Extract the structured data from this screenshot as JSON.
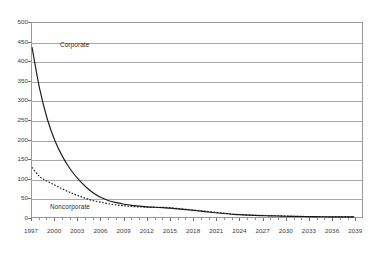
{
  "chart_data": {
    "type": "line",
    "title": "",
    "subtitle": "",
    "xlabel": "",
    "ylabel": "",
    "grid": true,
    "legend_position": "inline-annotation",
    "xlim": [
      1997,
      2040
    ],
    "ylim": [
      0,
      500
    ],
    "y_ticks": [
      0,
      50,
      100,
      150,
      200,
      250,
      300,
      350,
      400,
      450,
      500
    ],
    "x_ticks": [
      1997,
      2000,
      2003,
      2006,
      2009,
      2012,
      2015,
      2018,
      2021,
      2024,
      2027,
      2030,
      2033,
      2036,
      2039
    ],
    "x": [
      1997,
      1998,
      1999,
      2000,
      2001,
      2002,
      2003,
      2004,
      2005,
      2006,
      2007,
      2008,
      2009,
      2010,
      2011,
      2012,
      2013,
      2014,
      2015,
      2016,
      2017,
      2018,
      2019,
      2020,
      2021,
      2022,
      2023,
      2024,
      2025,
      2026,
      2027,
      2028,
      2029,
      2030,
      2031,
      2032,
      2033,
      2034,
      2035,
      2036,
      2037,
      2038,
      2039
    ],
    "series": [
      {
        "name": "Corporate",
        "style": "solid",
        "color": "#1a1a1a",
        "values": [
          438,
          330,
          252,
          196,
          155,
          123,
          98,
          78,
          62,
          50,
          42,
          37,
          33,
          30,
          28,
          26,
          25,
          24,
          23,
          21,
          19,
          17,
          15,
          13,
          11,
          9,
          7,
          6,
          5,
          4,
          3.5,
          3,
          2.5,
          2,
          1.6,
          1.3,
          1,
          0.8,
          0.6,
          0.5,
          0.4,
          0.3,
          0.2
        ]
      },
      {
        "name": "Noncorporate",
        "style": "dotted",
        "color": "#1a1a1a",
        "values": [
          128,
          104,
          92,
          82,
          72,
          63,
          55,
          48,
          42,
          38,
          34,
          31,
          29,
          27,
          26,
          25,
          25,
          25,
          24,
          22,
          20,
          18,
          16,
          14,
          12,
          10,
          8,
          6.5,
          5.5,
          4.5,
          4,
          3.5,
          3,
          2.5,
          2,
          1.6,
          1.2,
          0.9,
          0.7,
          0.5,
          0.4,
          0.3,
          0.2
        ]
      }
    ],
    "annotations": [
      {
        "text": "Corporate",
        "series": "Corporate"
      },
      {
        "text": "Noncorporate",
        "series": "Noncorporate"
      }
    ]
  }
}
